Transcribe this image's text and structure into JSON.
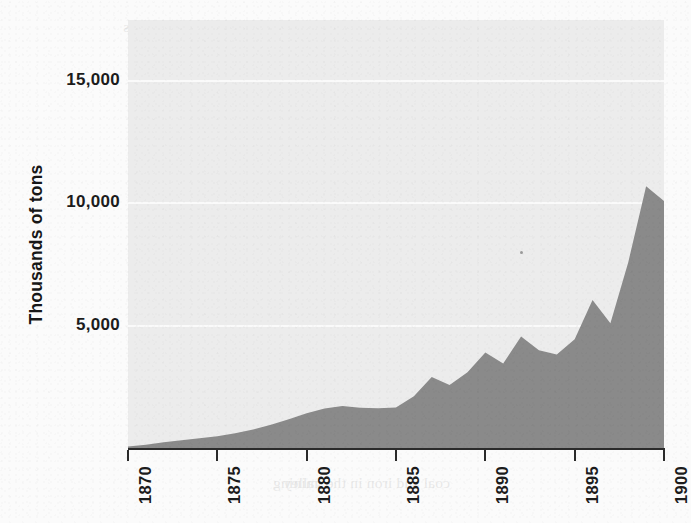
{
  "figure": {
    "page_background": "#fbfbfb",
    "panel_background": "#ececec",
    "gridline_color": "#fafafa",
    "axis_color": "#2b2b2b",
    "ylabel": "Thousands of tons"
  },
  "bleed_text": {
    "note": "faint mirrored show-through text from the reverse side of the printed page",
    "lines": [
      {
        "x": 18,
        "y": 14,
        "text": "the growth of the industry was"
      },
      {
        "x": 18,
        "y": 40,
        "text": "and the railroads carried it"
      },
      {
        "x": 18,
        "y": 66,
        "text": "of the"
      },
      {
        "x": 18,
        "y": 118,
        "text": "demand"
      },
      {
        "x": 18,
        "y": 144,
        "text": "rapidly"
      },
      {
        "x": 18,
        "y": 170,
        "text": "was the"
      },
      {
        "x": 340,
        "y": 150,
        "text": "output increased year by year"
      },
      {
        "x": 340,
        "y": 176,
        "text": "the mines could not keep pace"
      },
      {
        "x": 340,
        "y": 202,
        "text": "new shafts were sunk and the"
      },
      {
        "x": 340,
        "y": 228,
        "text": "veins were worked out within"
      },
      {
        "x": 340,
        "y": 254,
        "text": "a decade. Transport by rail"
      },
      {
        "x": 340,
        "y": 280,
        "text": "and by canal carried the coal"
      },
      {
        "x": 340,
        "y": 306,
        "text": "to the cities of the east, and"
      },
      {
        "x": 340,
        "y": 332,
        "text": "there it was consumed in"
      },
      {
        "x": 340,
        "y": 358,
        "text": "furnaces and stoves alike."
      },
      {
        "x": 18,
        "y": 300,
        "text": "history"
      },
      {
        "x": 18,
        "y": 380,
        "text": "output"
      },
      {
        "x": 18,
        "y": 470,
        "text": "mining"
      },
      {
        "x": 150,
        "y": 470,
        "text": "coal and iron in the valley"
      }
    ]
  },
  "chart_data": {
    "type": "area",
    "title": "",
    "xlabel": "",
    "ylabel": "Thousands of tons",
    "xlim": [
      1870,
      1900
    ],
    "ylim": [
      0,
      17500
    ],
    "grid": true,
    "gridlines_y": [
      5000,
      10000,
      15000
    ],
    "legend": null,
    "xticks": [
      1870,
      1875,
      1880,
      1885,
      1890,
      1895,
      1900
    ],
    "xticklabels": [
      "1870",
      "1875",
      "1880",
      "1885",
      "1890",
      "1895",
      "1900"
    ],
    "yticks": [
      5000,
      10000,
      15000
    ],
    "yticklabels": [
      "5,000",
      "10,000",
      "15,000"
    ],
    "series": [
      {
        "name": "Output",
        "fill_color": "#8a8a8a",
        "x": [
          1870,
          1871,
          1872,
          1873,
          1874,
          1875,
          1876,
          1877,
          1878,
          1879,
          1880,
          1881,
          1882,
          1883,
          1884,
          1885,
          1886,
          1887,
          1888,
          1889,
          1890,
          1891,
          1892,
          1893,
          1894,
          1895,
          1896,
          1897,
          1898,
          1899,
          1900
        ],
        "values": [
          60,
          130,
          230,
          320,
          400,
          480,
          600,
          760,
          950,
          1180,
          1420,
          1620,
          1720,
          1650,
          1630,
          1660,
          2120,
          2900,
          2580,
          3100,
          3900,
          3450,
          4560,
          4000,
          3820,
          4450,
          6050,
          5100,
          7600,
          10700,
          10100
        ]
      }
    ]
  },
  "annotations": {
    "speck": "print-speck"
  }
}
